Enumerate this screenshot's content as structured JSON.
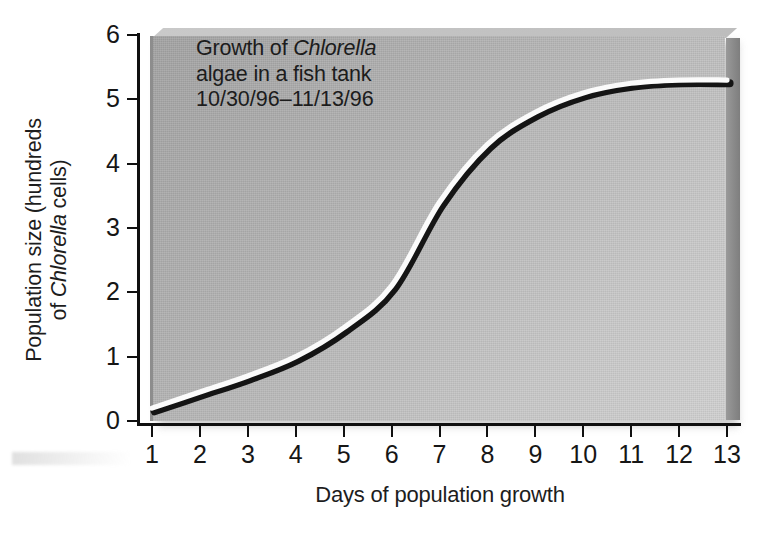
{
  "figure": {
    "title_line1_prefix": "Growth of ",
    "title_line1_italic": "Chlorella",
    "title_line2": "algae in a fish tank",
    "title_line3": "10/30/96–11/13/96",
    "xlabel": "Days of population growth",
    "ylabel_line1": "Population size (hundreds",
    "ylabel_line2_prefix": "of ",
    "ylabel_line2_italic": "Chlorella",
    "ylabel_line2_suffix": " cells)",
    "curve_color": "#fbfbfb",
    "curve_shadow_color": "#141414",
    "axis_color": "#101010",
    "panel_light": "#d1d1d1",
    "panel_dark": "#a4a4a4"
  },
  "chart_data": {
    "type": "line",
    "xlabel": "Days of population growth",
    "ylabel": "Population size (hundreds of Chlorella cells)",
    "xlim": [
      1,
      13
    ],
    "ylim": [
      0,
      6
    ],
    "xticks": [
      1,
      2,
      3,
      4,
      5,
      6,
      7,
      8,
      9,
      10,
      11,
      12,
      13
    ],
    "yticks": [
      0,
      1,
      2,
      3,
      4,
      5,
      6
    ],
    "grid": false,
    "legend": null,
    "series": [
      {
        "name": "Chlorella population",
        "x": [
          1,
          2,
          3,
          4,
          5,
          6,
          7,
          8,
          9,
          10,
          11,
          12,
          13
        ],
        "values": [
          0.2,
          0.45,
          0.7,
          1.0,
          1.45,
          2.1,
          3.4,
          4.3,
          4.8,
          5.1,
          5.25,
          5.3,
          5.3
        ]
      }
    ]
  }
}
